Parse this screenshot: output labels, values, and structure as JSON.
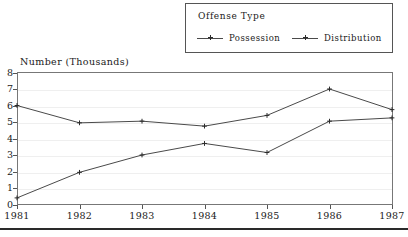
{
  "legend": {
    "title": "Offense Type",
    "entries": [
      {
        "label": "Possession",
        "marker": "plus-line-marker",
        "color": "#4a4a4a"
      },
      {
        "label": "Distribution",
        "marker": "plus-line-marker",
        "color": "#4a4a4a"
      }
    ]
  },
  "axes": {
    "y_title": "Number (Thousands)",
    "y_ticks": [
      "0",
      "1",
      "2",
      "3",
      "4",
      "5",
      "6",
      "7",
      "8"
    ],
    "x_ticks": [
      "1981",
      "1982",
      "1983",
      "1984",
      "1985",
      "1986",
      "1987"
    ]
  },
  "chart_data": {
    "type": "line",
    "title": "",
    "xlabel": "",
    "ylabel": "Number (Thousands)",
    "x": [
      1981,
      1982,
      1983,
      1984,
      1985,
      1986,
      1987
    ],
    "categories": [
      "1981",
      "1982",
      "1983",
      "1984",
      "1985",
      "1986",
      "1987"
    ],
    "series": [
      {
        "name": "Possession",
        "values": [
          6.0,
          4.95,
          5.05,
          4.75,
          5.4,
          7.0,
          5.75
        ],
        "color": "#4a4a4a",
        "marker": "plus"
      },
      {
        "name": "Distribution",
        "values": [
          0.4,
          1.95,
          3.0,
          3.7,
          3.15,
          5.05,
          5.25
        ],
        "color": "#4a4a4a",
        "marker": "plus"
      }
    ],
    "ylim": [
      0,
      8
    ],
    "xlim": [
      1981,
      1987
    ],
    "ytick_step": 1,
    "grid": true,
    "grid_axis": "y",
    "legend_position": "top-right",
    "legend_title": "Offense Type"
  }
}
